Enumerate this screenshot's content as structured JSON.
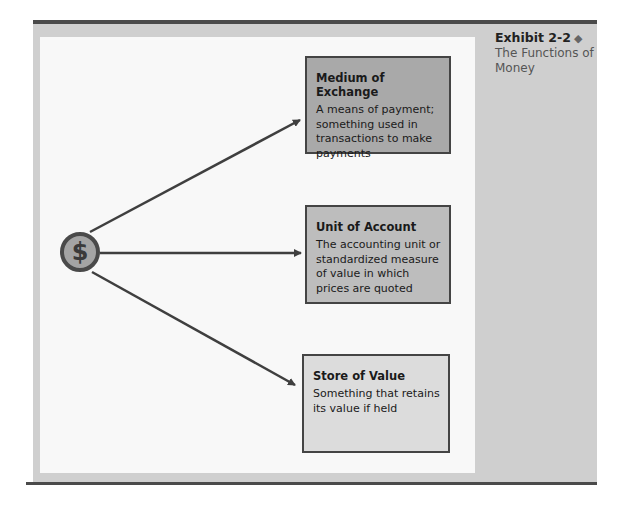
{
  "caption": {
    "exhibit_number": "Exhibit 2-2",
    "marker_icon": "diamond-icon",
    "title": "The Functions of Money"
  },
  "center": {
    "icon": "dollar-coin-icon",
    "symbol": "$"
  },
  "functions": [
    {
      "title": "Medium of Exchange",
      "description": "A means of payment; something used in transactions to make payments"
    },
    {
      "title": "Unit of Account",
      "description": "The accounting unit or standardized measure of value in which prices are quoted"
    },
    {
      "title": "Store of Value",
      "description": "Something that retains its value if held"
    }
  ],
  "colors": {
    "rule": "#4a4a4a",
    "panel": "#cfcfcf",
    "canvas": "#f8f8f8",
    "box_medium": "#a9a9a9",
    "box_unit": "#bdbdbd",
    "box_store": "#dcdcdc",
    "arrow": "#3f3f3f"
  }
}
